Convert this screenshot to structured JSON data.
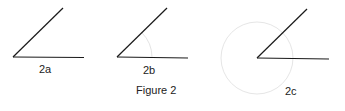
{
  "figure": {
    "caption": "Figure 2",
    "panels": [
      {
        "label": "2a",
        "vertex": [
          13,
          57
        ],
        "ray_end": [
          63,
          8
        ],
        "base_end": [
          84,
          57
        ],
        "arc": "none"
      },
      {
        "label": "2b",
        "vertex": [
          117,
          57
        ],
        "ray_end": [
          167,
          8
        ],
        "base_end": [
          188,
          58
        ],
        "arc": "partial"
      },
      {
        "label": "2c",
        "vertex": [
          257,
          58
        ],
        "ray_end": [
          307,
          9
        ],
        "base_end": [
          329,
          59
        ],
        "arc": "full-circle"
      }
    ],
    "colors": {
      "line": "#1a1a1a",
      "arc": "#e4e4e4",
      "text": "#222222"
    }
  }
}
